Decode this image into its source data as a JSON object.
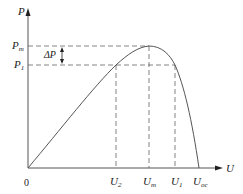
{
  "diagram": {
    "axes": {
      "y_label": "P",
      "x_label": "U",
      "origin_label": "0"
    },
    "y_markers": [
      {
        "id": "Pm",
        "base": "P",
        "sub": "m"
      },
      {
        "id": "P1",
        "base": "P",
        "sub": "1"
      }
    ],
    "delta_label": "ΔP",
    "x_markers": [
      {
        "id": "U2",
        "base": "U",
        "sub": "2"
      },
      {
        "id": "Um",
        "base": "U",
        "sub": "m"
      },
      {
        "id": "U1",
        "base": "U",
        "sub": "1"
      },
      {
        "id": "Uoc",
        "base": "U",
        "sub": "oc"
      }
    ],
    "colors": {
      "line": "#555555",
      "dash": "#666666",
      "text": "#222222"
    }
  }
}
